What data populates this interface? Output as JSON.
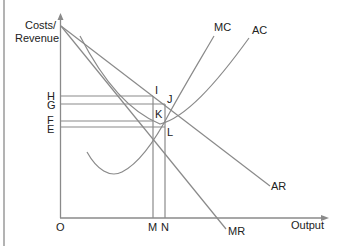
{
  "diagram": {
    "type": "economics-cost-revenue-diagram",
    "y_axis_label_line1": "Costs/",
    "y_axis_label_line2": "Revenue",
    "x_axis_label": "Output",
    "origin_label": "O",
    "y_ticks": [
      {
        "label": "H",
        "y": 96
      },
      {
        "label": "G",
        "y": 104
      },
      {
        "label": "F",
        "y": 121
      },
      {
        "label": "E",
        "y": 127
      }
    ],
    "x_ticks": [
      {
        "label": "M",
        "x": 153
      },
      {
        "label": "N",
        "x": 165
      }
    ],
    "points": {
      "I": "I",
      "J": "J",
      "K": "K",
      "L": "L"
    },
    "curves": {
      "MC": "MC",
      "AC": "AC",
      "AR": "AR",
      "MR": "MR"
    },
    "colors": {
      "line": "#8a8a8a",
      "text": "#222222",
      "background": "#ffffff"
    }
  }
}
